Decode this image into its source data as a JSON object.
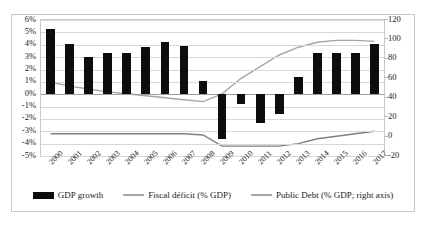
{
  "chart_data": {
    "type": "bar",
    "title": "",
    "xlabel": "",
    "ylabel": "",
    "grid": true,
    "legend_position": "bottom",
    "categories": [
      "2000",
      "2001",
      "2002",
      "2003",
      "2004",
      "2005",
      "2006",
      "2007",
      "2008",
      "2009",
      "2010",
      "2011",
      "2012",
      "2013",
      "2014",
      "2015",
      "2016",
      "2017"
    ],
    "left_axis": {
      "ylim": [
        -5,
        6
      ],
      "ticks": [
        "6%",
        "5%",
        "4%",
        "3%",
        "2%",
        "1%",
        "0%",
        "-1%",
        "-2%",
        "-3%",
        "-4%",
        "-5%"
      ],
      "tick_values": [
        6,
        5,
        4,
        3,
        2,
        1,
        0,
        -1,
        -2,
        -3,
        -4,
        -5
      ]
    },
    "right_axis": {
      "ylim": [
        -20,
        120
      ],
      "ticks": [
        "120",
        "100",
        "80",
        "60",
        "40",
        "20",
        "0",
        "-20"
      ],
      "tick_values": [
        120,
        100,
        80,
        60,
        40,
        20,
        0,
        -20
      ]
    },
    "series": [
      {
        "name": "GDP growth",
        "type": "bar",
        "axis": "left",
        "color": "#0d0d0d",
        "values": [
          5.3,
          4.1,
          3.0,
          3.3,
          3.3,
          3.8,
          4.2,
          3.9,
          1.1,
          -3.6,
          -0.8,
          -2.3,
          -1.6,
          1.4,
          3.3,
          3.3,
          3.3,
          4.1
        ]
      },
      {
        "name": "Fiscal déficit (% GDP)",
        "type": "line",
        "axis": "left",
        "color": "#808080",
        "values": [
          -3.2,
          -3.2,
          -3.2,
          -3.2,
          -3.2,
          -3.2,
          -3.2,
          -3.2,
          -3.3,
          -4.2,
          -4.2,
          -4.2,
          -4.2,
          -4.0,
          -3.6,
          -3.4,
          -3.2,
          -3.0
        ]
      },
      {
        "name": "Public Debt (% GDP; right axis)",
        "type": "line",
        "axis": "right",
        "color": "#a6a6a6",
        "values": [
          56,
          52,
          49,
          46,
          44,
          42,
          40,
          38,
          36,
          44,
          60,
          72,
          84,
          92,
          97,
          99,
          99,
          98
        ]
      }
    ]
  },
  "legend": {
    "items": [
      {
        "label": "GDP growth",
        "marker": "bar-swatch"
      },
      {
        "label": "Fiscal déficit (% GDP)",
        "marker": "line-swatch"
      },
      {
        "label": "Public Debt (% GDP; right axis)",
        "marker": "line-swatch"
      }
    ]
  }
}
